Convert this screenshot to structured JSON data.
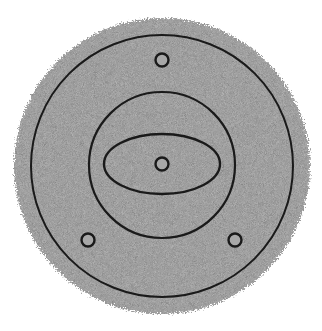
{
  "diagram": {
    "colors": {
      "background": "#ffffff",
      "disc_fill": "#b8b8b8",
      "line": "#1a1a1a",
      "marker_fill": "#a8a8a8"
    },
    "disc": {
      "cx": 162,
      "cy": 166,
      "r": 148
    },
    "outer_circle": {
      "cx": 162,
      "cy": 166,
      "r": 131
    },
    "inner_circle": {
      "cx": 162,
      "cy": 165,
      "r": 73
    },
    "ellipse": {
      "cx": 162,
      "cy": 164,
      "rx": 58,
      "ry": 30
    },
    "markers": [
      {
        "name": "center",
        "cx": 162,
        "cy": 164,
        "r": 6.5
      },
      {
        "name": "top",
        "cx": 162,
        "cy": 60,
        "r": 6.5
      },
      {
        "name": "bottom-left",
        "cx": 88,
        "cy": 240,
        "r": 6.5
      },
      {
        "name": "bottom-right",
        "cx": 235,
        "cy": 240,
        "r": 6.5
      }
    ]
  }
}
